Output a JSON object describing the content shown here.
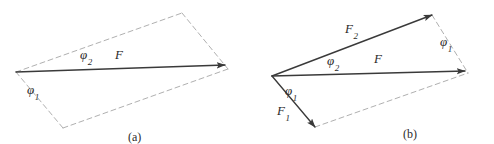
{
  "figure": {
    "width": 494,
    "height": 144,
    "background": "#ffffff",
    "solid_color": "#3a3a3a",
    "dashed_color": "#b0b0b0"
  },
  "chart_data": {
    "type": "diagram",
    "title": "",
    "panels": [
      {
        "caption": "(a)",
        "caption_pos": [
          128,
          131
        ],
        "origin": [
          16,
          72
        ],
        "vectors": [
          {
            "name": "F",
            "label": "F",
            "from": [
              16,
              72
            ],
            "to": [
              225,
              65
            ],
            "style": "solid",
            "arrowhead": true,
            "label_pos": [
              115,
              48
            ]
          }
        ],
        "dashed_edges": [
          {
            "from": [
              16,
              72
            ],
            "to": [
              182,
              13
            ]
          },
          {
            "from": [
              182,
              13
            ],
            "to": [
              228,
              69
            ]
          },
          {
            "from": [
              16,
              72
            ],
            "to": [
              63,
              128
            ]
          },
          {
            "from": [
              63,
              128
            ],
            "to": [
              228,
              69
            ]
          }
        ],
        "angle_labels": [
          {
            "label": "φ",
            "sub": "1",
            "pos": [
              27,
              83
            ]
          },
          {
            "label": "φ",
            "sub": "2",
            "pos": [
              80,
              48
            ]
          }
        ]
      },
      {
        "caption": "(b)",
        "caption_pos": [
          403,
          128
        ],
        "origin": [
          272,
          76
        ],
        "vectors": [
          {
            "name": "F1",
            "label": "F",
            "sub": "1",
            "from": [
              272,
              76
            ],
            "to": [
              315,
              127
            ],
            "style": "solid",
            "arrowhead": true,
            "label_pos": [
              277,
              104
            ]
          },
          {
            "name": "F2",
            "label": "F",
            "sub": "2",
            "from": [
              272,
              76
            ],
            "to": [
              432,
              15
            ],
            "style": "solid",
            "arrowhead": true,
            "label_pos": [
              345,
              22
            ]
          },
          {
            "name": "F",
            "label": "F",
            "from": [
              272,
              76
            ],
            "to": [
              465,
              71
            ],
            "style": "solid",
            "arrowhead": true,
            "label_pos": [
              374,
              52
            ]
          }
        ],
        "dashed_edges": [
          {
            "from": [
              432,
              15
            ],
            "to": [
              468,
              73
            ]
          },
          {
            "from": [
              315,
              127
            ],
            "to": [
              468,
              73
            ]
          }
        ],
        "angle_labels": [
          {
            "label": "φ",
            "sub": "1",
            "pos": [
              285,
              84
            ]
          },
          {
            "label": "φ",
            "sub": "2",
            "pos": [
              327,
              54
            ]
          },
          {
            "label": "φ",
            "sub": "1",
            "pos": [
              440,
              35
            ]
          }
        ]
      }
    ]
  }
}
